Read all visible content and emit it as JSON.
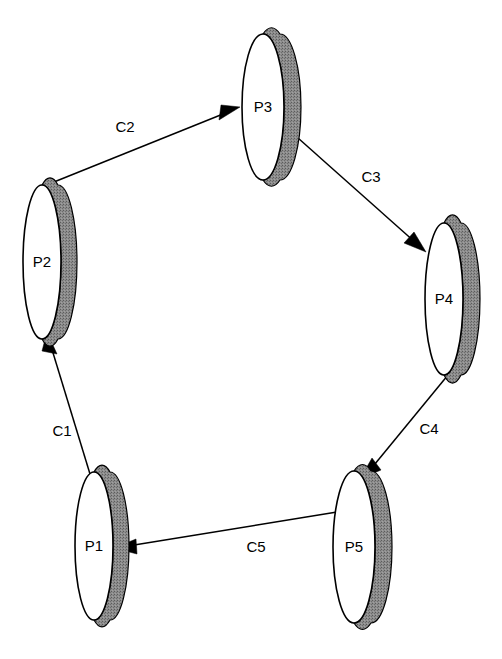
{
  "diagram": {
    "type": "cycle-graph",
    "canvas": {
      "width": 502,
      "height": 659,
      "background": "#ffffff"
    },
    "style": {
      "node_shape": "disc",
      "node_fill": "#ffffff",
      "node_stroke": "#000000",
      "shadow_fill": "#808080",
      "shadow_offset_x": 16,
      "edge_stroke": "#000000",
      "label_color": "#000000"
    },
    "nodes": [
      {
        "id": "P1",
        "label": "P1",
        "cx": 94,
        "cy": 546,
        "rx": 19,
        "ry": 74
      },
      {
        "id": "P2",
        "label": "P2",
        "cx": 42,
        "cy": 262,
        "rx": 19,
        "ry": 77
      },
      {
        "id": "P3",
        "label": "P3",
        "cx": 263,
        "cy": 107,
        "rx": 21,
        "ry": 73
      },
      {
        "id": "P4",
        "label": "P4",
        "cx": 444,
        "cy": 299,
        "rx": 19,
        "ry": 76
      },
      {
        "id": "P5",
        "label": "P5",
        "cx": 354,
        "cy": 547,
        "rx": 21,
        "ry": 76
      }
    ],
    "edges": [
      {
        "id": "C1",
        "label": "C1",
        "from": "P1",
        "to": "P2",
        "label_x": 62,
        "label_y": 432
      },
      {
        "id": "C2",
        "label": "C2",
        "from": "P2",
        "to": "P3",
        "label_x": 125,
        "label_y": 128
      },
      {
        "id": "C3",
        "label": "C3",
        "from": "P3",
        "to": "P4",
        "label_x": 371,
        "label_y": 178
      },
      {
        "id": "C4",
        "label": "C4",
        "from": "P4",
        "to": "P5",
        "label_x": 429,
        "label_y": 430
      },
      {
        "id": "C5",
        "label": "C5",
        "from": "P5",
        "to": "P1",
        "label_x": 256,
        "label_y": 548
      }
    ]
  }
}
